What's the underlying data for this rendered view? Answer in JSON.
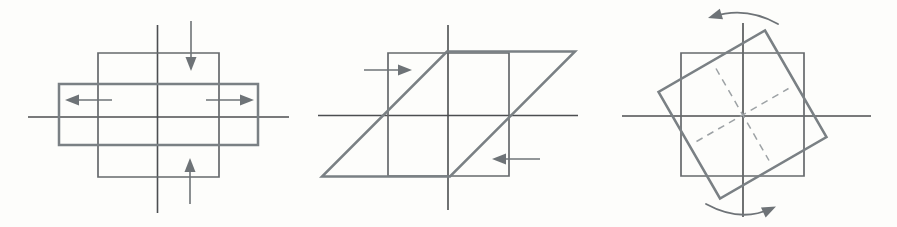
{
  "figure": {
    "name": "strain-deformation-diagrams",
    "width": 897,
    "height": 227,
    "background": "#fdfdfb",
    "colors": {
      "axis": "#4c4e50",
      "original_shape": "#66696c",
      "deformed_shape": "#7a8084",
      "arrow": "#6e7377",
      "dashed": "#9da2a5"
    },
    "stroke_widths": {
      "axis": 1.6,
      "original_shape": 1.7,
      "deformed_shape": 2.5,
      "arrow_shaft": 1.6,
      "curved_arrow": 1.8,
      "dashed": 1.5
    },
    "panels": [
      {
        "name": "coaxial-flattening",
        "description": "square shortened vertically and stretched horizontally into a wide rectangle",
        "axes": [
          {
            "name": "horizontal-axis",
            "x1": 28,
            "y1": 117,
            "x2": 289,
            "y2": 117
          },
          {
            "name": "vertical-axis",
            "x1": 157.5,
            "y1": 25,
            "x2": 157.5,
            "y2": 213
          }
        ],
        "original_square": {
          "name": "original-square",
          "points": [
            [
              98,
              53
            ],
            [
              219,
              53
            ],
            [
              219,
              177
            ],
            [
              98,
              177
            ]
          ]
        },
        "deformed_shape": {
          "name": "deformed-rectangle",
          "points": [
            [
              59,
              84
            ],
            [
              258,
              84
            ],
            [
              258,
              145
            ],
            [
              59,
              145
            ]
          ]
        },
        "arrows": [
          {
            "name": "compress-down-arrow",
            "tail": [
              191,
              21
            ],
            "tip": [
              191,
              71
            ]
          },
          {
            "name": "compress-up-arrow",
            "tail": [
              190,
              204
            ],
            "tip": [
              190,
              158
            ]
          },
          {
            "name": "extend-left-arrow",
            "tail": [
              112,
              100
            ],
            "tip": [
              65,
              100
            ]
          },
          {
            "name": "extend-right-arrow",
            "tail": [
              206,
              100
            ],
            "tip": [
              254,
              100
            ]
          }
        ]
      },
      {
        "name": "simple-shear",
        "description": "square sheared into a parallelogram, top displaced right and bottom displaced left",
        "axes": [
          {
            "name": "horizontal-axis",
            "x1": 318,
            "y1": 115.5,
            "x2": 578,
            "y2": 115.5
          },
          {
            "name": "vertical-axis",
            "x1": 448,
            "y1": 25,
            "x2": 448,
            "y2": 210
          }
        ],
        "original_square": {
          "name": "original-square",
          "points": [
            [
              388,
              53
            ],
            [
              509,
              53
            ],
            [
              509,
              176
            ],
            [
              388,
              176
            ]
          ]
        },
        "deformed_shape": {
          "name": "deformed-parallelogram",
          "points": [
            [
              447,
              51.5
            ],
            [
              575,
              51.5
            ],
            [
              450,
              176.5
            ],
            [
              322,
              176.5
            ]
          ]
        },
        "arrows": [
          {
            "name": "shear-right-arrow",
            "tail": [
              364,
              70
            ],
            "tip": [
              412,
              70
            ]
          },
          {
            "name": "shear-left-arrow",
            "tail": [
              540,
              159
            ],
            "tip": [
              492,
              159
            ]
          }
        ]
      },
      {
        "name": "rigid-rotation",
        "description": "square rotated about 30 degrees counterclockwise, dashed medians mark rotated axes",
        "axes": [
          {
            "name": "horizontal-axis",
            "x1": 622,
            "y1": 116,
            "x2": 871,
            "y2": 116
          },
          {
            "name": "vertical-axis",
            "x1": 743,
            "y1": 23,
            "x2": 743,
            "y2": 217
          }
        ],
        "original_square": {
          "name": "original-square",
          "points": [
            [
              681,
              53
            ],
            [
              804,
              53
            ],
            [
              804,
              176
            ],
            [
              681,
              176
            ]
          ]
        },
        "deformed_shape": {
          "name": "rotated-square",
          "points": [
            [
              765,
              30.5
            ],
            [
              826.5,
              137
            ],
            [
              720,
              198.5
            ],
            [
              658.5,
              92
            ]
          ]
        },
        "dashed_lines": [
          {
            "name": "rotated-horizontal-median",
            "x1": 696.5,
            "y1": 141.5,
            "x2": 788.5,
            "y2": 88.5
          },
          {
            "name": "rotated-vertical-median",
            "x1": 716,
            "y1": 68.5,
            "x2": 769,
            "y2": 160.5
          }
        ],
        "curved_arrows": [
          {
            "name": "rotation-arrow-top",
            "path": "M 778 24 Q 746 6 713 16.5",
            "head_tip": [
              708,
              18
            ],
            "head_angle": 163
          },
          {
            "name": "rotation-arrow-bottom",
            "path": "M 706 204 Q 741 223 771 208.5",
            "head_tip": [
              776,
              206.5
            ],
            "head_angle": -25
          }
        ]
      }
    ]
  }
}
